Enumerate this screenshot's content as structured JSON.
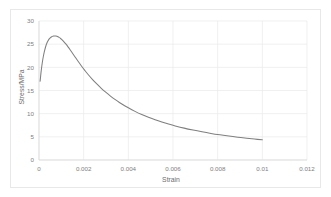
{
  "chart_data": {
    "type": "line",
    "title": "",
    "xlabel": "Strain",
    "ylabel": "Stress/MPa",
    "xlim": [
      0,
      0.012
    ],
    "ylim": [
      0,
      30
    ],
    "xticks": [
      "0",
      "0.002",
      "0.004",
      "0.006",
      "0.008",
      "0.01",
      "0.012"
    ],
    "xtick_values": [
      0,
      0.002,
      0.004,
      0.006,
      0.008,
      0.01,
      0.012
    ],
    "yticks": [
      "0",
      "5",
      "10",
      "15",
      "20",
      "25",
      "30"
    ],
    "ytick_values": [
      0,
      5,
      10,
      15,
      20,
      25,
      30
    ],
    "grid": "both",
    "legend": "none",
    "series": [
      {
        "name": "Stress-Strain",
        "color": "#7f7f7f",
        "x": [
          5e-05,
          0.0001,
          0.00015,
          0.0002,
          0.00025,
          0.0003,
          0.00035,
          0.0004,
          0.00045,
          0.0005,
          0.00055,
          0.0006,
          0.00065,
          0.0007,
          0.00075,
          0.0008,
          0.00085,
          0.0009,
          0.00095,
          0.001,
          0.0011,
          0.0012,
          0.0013,
          0.0014,
          0.0015,
          0.0016,
          0.00175,
          0.0019,
          0.00205,
          0.0022,
          0.0024,
          0.0026,
          0.0028,
          0.003,
          0.0032,
          0.0034,
          0.0036,
          0.0038,
          0.004,
          0.0043,
          0.0046,
          0.0049,
          0.0052,
          0.0055,
          0.0058,
          0.0061,
          0.0065,
          0.0069,
          0.0073,
          0.0077,
          0.0081,
          0.0085,
          0.0089,
          0.0093,
          0.00965,
          0.01
        ],
        "y": [
          17.0,
          19.3,
          21.1,
          22.5,
          23.6,
          24.5,
          25.2,
          25.7,
          26.1,
          26.35,
          26.55,
          26.68,
          26.75,
          26.78,
          26.76,
          26.7,
          26.6,
          26.46,
          26.3,
          26.1,
          25.62,
          25.05,
          24.42,
          23.75,
          23.05,
          22.35,
          21.3,
          20.3,
          19.35,
          18.45,
          17.35,
          16.35,
          15.42,
          14.58,
          13.8,
          13.08,
          12.42,
          11.82,
          11.26,
          10.5,
          9.82,
          9.22,
          8.68,
          8.2,
          7.76,
          7.36,
          6.88,
          6.46,
          6.08,
          5.74,
          5.44,
          5.16,
          4.92,
          4.7,
          4.52,
          4.35
        ]
      }
    ]
  },
  "colors": {
    "series": "#7f7f7f",
    "grid": "#eaeaea",
    "axis": "#d9d9d9",
    "text": "#808080",
    "border": "#e8e8e8",
    "background": "#ffffff"
  }
}
